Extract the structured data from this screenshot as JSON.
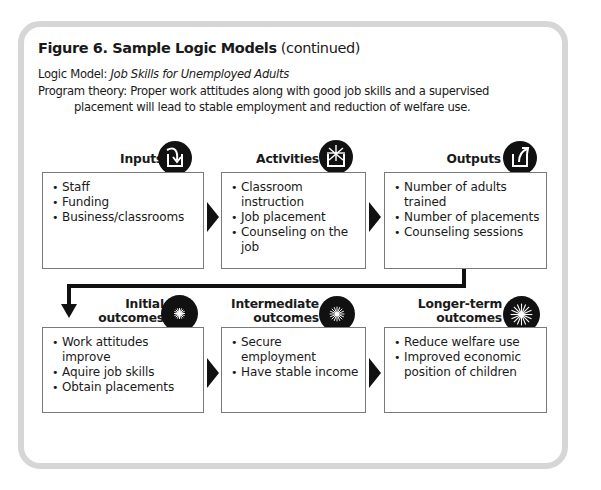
{
  "figure": {
    "title_bold": "Figure 6.  Sample Logic Models",
    "title_suffix": " (continued)",
    "logic_model_label": "Logic Model:  ",
    "logic_model_name": "Job Skills for Unemployed Adults",
    "program_theory_line1": "Program theory:  Proper work attitudes along with good job skills and a supervised",
    "program_theory_line2": "placement will lead to stable employment and reduction of welfare use."
  },
  "stages": [
    {
      "label_line1": "Inputs",
      "label_line2": "",
      "icon": "input-arrow-icon",
      "items": [
        "Staff",
        "Funding",
        "Business/classrooms"
      ]
    },
    {
      "label_line1": "Activities",
      "label_line2": "",
      "icon": "activity-burst-icon",
      "items": [
        "Classroom instruction",
        "Job placement",
        "Counseling on the job"
      ]
    },
    {
      "label_line1": "Outputs",
      "label_line2": "",
      "icon": "output-arrow-icon",
      "items": [
        "Number of adults trained",
        "Number of placements",
        "Counseling sessions"
      ]
    },
    {
      "label_line1": "Initial",
      "label_line2": "outcomes",
      "icon": "small-starburst-icon",
      "items": [
        "Work attitudes improve",
        "Aquire job skills",
        "Obtain placements"
      ]
    },
    {
      "label_line1": "Intermediate",
      "label_line2": "outcomes",
      "icon": "medium-starburst-icon",
      "items": [
        "Secure employment",
        "Have stable income"
      ]
    },
    {
      "label_line1": "Longer-term",
      "label_line2": "outcomes",
      "icon": "large-starburst-icon",
      "items": [
        "Reduce welfare use",
        "Improved economic position of children"
      ]
    }
  ],
  "colors": {
    "frame": "#d6d6d6",
    "box_border": "#7a7a7a",
    "ink": "#111111"
  }
}
